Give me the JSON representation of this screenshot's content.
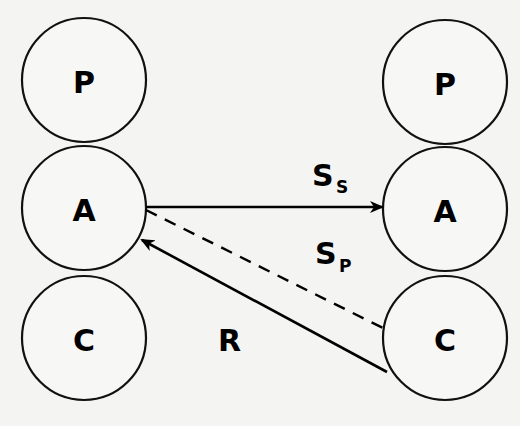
{
  "diagram": {
    "left_column": {
      "nodes": [
        {
          "label": "P",
          "cx": 84,
          "cy": 80,
          "r": 62
        },
        {
          "label": "A",
          "cx": 84,
          "cy": 208,
          "r": 62
        },
        {
          "label": "C",
          "cx": 84,
          "cy": 338,
          "r": 62
        }
      ]
    },
    "right_column": {
      "nodes": [
        {
          "label": "P",
          "cx": 445,
          "cy": 82,
          "r": 62
        },
        {
          "label": "A",
          "cx": 445,
          "cy": 209,
          "r": 62
        },
        {
          "label": "C",
          "cx": 445,
          "cy": 338,
          "r": 62
        }
      ]
    },
    "edges": [
      {
        "id": "ss",
        "label": "S",
        "sub": "S",
        "from": "left.A",
        "to": "right.A",
        "style": "solid",
        "arrow": "end"
      },
      {
        "id": "sp",
        "label": "S",
        "sub": "P",
        "from": "left.A",
        "to": "right.C",
        "style": "dashed",
        "arrow": "none"
      },
      {
        "id": "r",
        "label": "R",
        "sub": "",
        "from": "right.C",
        "to": "left.A",
        "style": "solid",
        "arrow": "end"
      }
    ]
  }
}
